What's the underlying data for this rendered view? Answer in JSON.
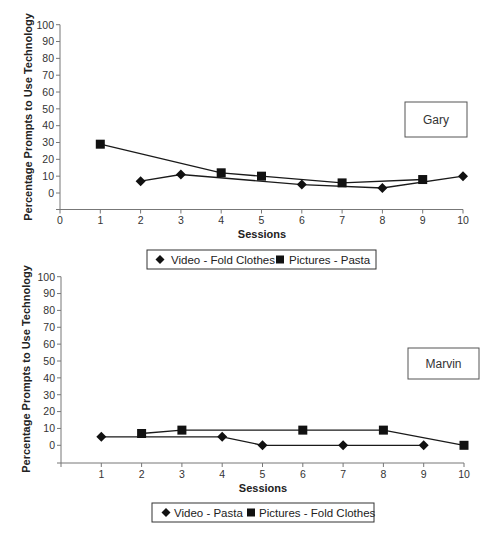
{
  "chart_data": [
    {
      "type": "line",
      "title": "",
      "participant": "Gary",
      "xlabel": "Sessions",
      "ylabel": "Percentage Prompts to Use Technology",
      "xlim": [
        0,
        10
      ],
      "ylim": [
        -10,
        100
      ],
      "x_ticks": [
        "0",
        "1",
        "2",
        "3",
        "4",
        "5",
        "6",
        "7",
        "8",
        "9",
        "10"
      ],
      "y_ticks": [
        "0",
        "10",
        "20",
        "30",
        "40",
        "50",
        "60",
        "70",
        "80",
        "90",
        "100"
      ],
      "grid": false,
      "legend_position": "bottom",
      "series": [
        {
          "name": "Video - Fold Clothes",
          "marker": "diamond",
          "x": [
            2,
            3,
            6,
            8,
            10
          ],
          "values": [
            7,
            11,
            5,
            3,
            10
          ]
        },
        {
          "name": "Pictures - Pasta",
          "marker": "square",
          "x": [
            1,
            4,
            5,
            7,
            9
          ],
          "values": [
            29,
            12,
            10,
            6,
            8
          ]
        }
      ]
    },
    {
      "type": "line",
      "title": "",
      "participant": "Marvin",
      "xlabel": "Sessions",
      "ylabel": "Percentage Prompts to Use Technology",
      "xlim": [
        0,
        10
      ],
      "ylim": [
        -10,
        100
      ],
      "x_ticks": [
        "",
        "1",
        "2",
        "3",
        "4",
        "5",
        "6",
        "7",
        "8",
        "9",
        "10"
      ],
      "y_ticks": [
        "0",
        "10",
        "20",
        "30",
        "40",
        "50",
        "60",
        "70",
        "80",
        "90",
        "100"
      ],
      "grid": false,
      "legend_position": "bottom",
      "series": [
        {
          "name": "Video - Pasta",
          "marker": "diamond",
          "x": [
            1,
            4,
            5,
            7,
            9
          ],
          "values": [
            5,
            5,
            0,
            0,
            0
          ]
        },
        {
          "name": "Pictures - Fold Clothes",
          "marker": "square",
          "x": [
            2,
            3,
            6,
            8,
            10
          ],
          "values": [
            7,
            9,
            9,
            9,
            0
          ]
        }
      ]
    }
  ],
  "charts": [
    {
      "participant_label": "Gary",
      "xlabel": "Sessions",
      "ylabel": "Percentage Prompts to Use Technology",
      "legend": [
        "Video - Fold Clothes",
        "Pictures - Pasta"
      ]
    },
    {
      "participant_label": "Marvin",
      "xlabel": "Sessions",
      "ylabel": "Percentage Prompts to Use Technology",
      "legend": [
        "Video - Pasta",
        "Pictures - Fold Clothes"
      ]
    }
  ],
  "colors": {
    "line": "#1a1a1a",
    "axis": "#777777",
    "marker": "#111111",
    "box_border": "#555555"
  }
}
